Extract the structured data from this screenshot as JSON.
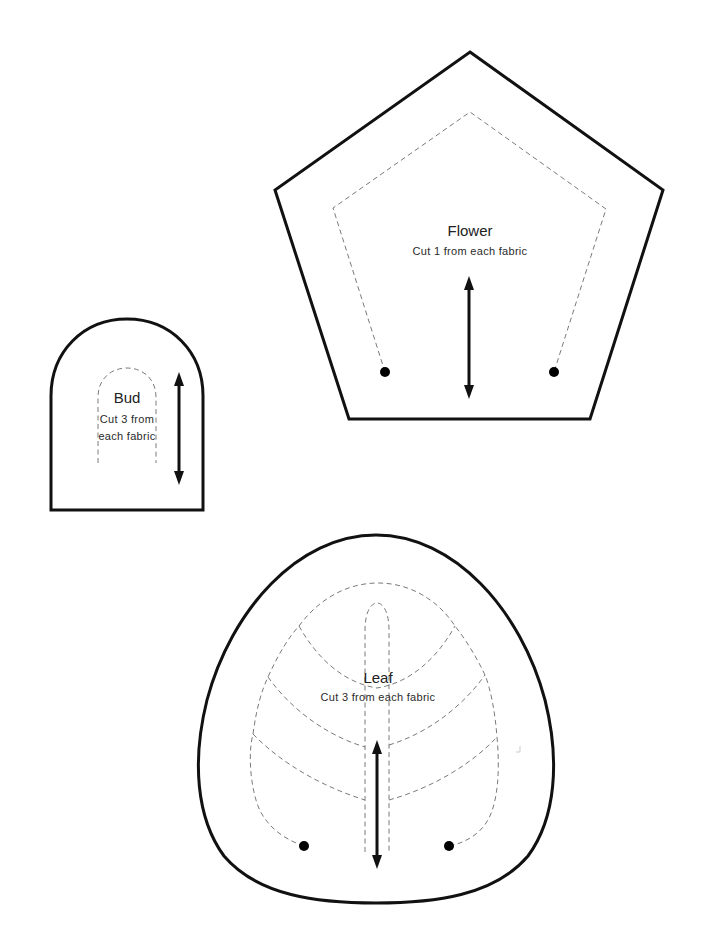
{
  "page": {
    "background": "#ffffff",
    "ink_color": "#111111",
    "seam_color": "#7a7a7a"
  },
  "pieces": {
    "flower": {
      "title": "Flower",
      "instruction": "Cut 1 from each fabric",
      "shape": "pentagon",
      "has_grainline_arrow": true,
      "dots": 2
    },
    "bud": {
      "title": "Bud",
      "instruction_line1": "Cut 3 from",
      "instruction_line2": "each fabric",
      "shape": "arch",
      "has_grainline_arrow": true,
      "dots": 0
    },
    "leaf": {
      "title": "Leaf",
      "instruction": "Cut 3 from each fabric",
      "shape": "rounded-triangle",
      "has_grainline_arrow": true,
      "dots": 2,
      "vein_pairs": 3
    }
  },
  "legend": {
    "solid_line": "cutting line",
    "dashed_line": "stitching / placement line",
    "double_arrow": "grainline",
    "dot": "matching point"
  }
}
